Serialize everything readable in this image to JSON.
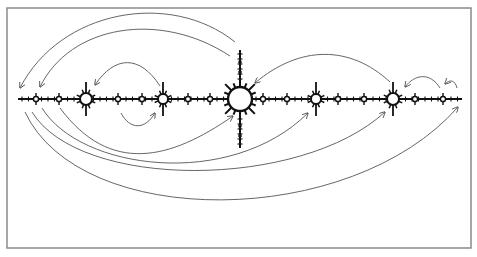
{
  "diagram": {
    "type": "node-link diagram along a horizontal axis",
    "colors": {
      "background": "#ffffff",
      "frame": "#8a8a8a",
      "axis": "#111111",
      "arc": "#555555"
    },
    "frame": {
      "x": 7,
      "y": 8,
      "width": 464,
      "height": 240
    },
    "axis": {
      "y": 99,
      "x_start": 18,
      "x_end": 462
    },
    "hub": {
      "x": 240,
      "y": 99,
      "r": 12,
      "spike_count": 16,
      "stem_top": 50,
      "stem_bottom": 148
    },
    "medium_nodes": [
      {
        "x": 86,
        "r": 6
      },
      {
        "x": 163,
        "r": 5
      },
      {
        "x": 316,
        "r": 5
      },
      {
        "x": 393,
        "r": 6
      }
    ],
    "small_nodes": [
      36,
      59,
      118,
      142,
      188,
      210,
      263,
      287,
      338,
      364,
      415,
      443
    ],
    "arcs": [
      {
        "name": "top-outer",
        "d": "M 235 42 C 170 -10, 60 10, 20 88",
        "arrow_end": true
      },
      {
        "name": "top-inner",
        "d": "M 230 56 C 160 10, 70 25, 40 87",
        "arrow_end": true
      },
      {
        "name": "top-small-left",
        "d": "M 160 86 C 140 55, 115 55, 95 85",
        "arrow_end": true
      },
      {
        "name": "top-right-to-hub",
        "d": "M 390 82 C 350 45, 300 45, 255 83",
        "arrow_end": true
      },
      {
        "name": "top-right-small",
        "d": "M 440 88 C 430 72, 415 74, 405 87",
        "arrow_end": true
      },
      {
        "name": "top-right-tiny",
        "d": "M 457 88 C 455 80, 450 79, 445 84",
        "arrow_end": true
      },
      {
        "name": "bottom-small-loop",
        "d": "M 121 113 C 130 130, 145 130, 155 113",
        "arrow_end": true
      },
      {
        "name": "bottom-1",
        "d": "M 60 108 C 110 175, 170 160, 233 116",
        "arrow_end": true
      },
      {
        "name": "bottom-2",
        "d": "M 42 108 C 80 170, 230 190, 308 113",
        "arrow_end": true
      },
      {
        "name": "bottom-3",
        "d": "M 32 112 C 80 190, 300 190, 385 112",
        "arrow_end": true
      },
      {
        "name": "bottom-4",
        "d": "M 25 112 C 80 230, 350 230, 458 107",
        "arrow_end": true
      }
    ]
  }
}
